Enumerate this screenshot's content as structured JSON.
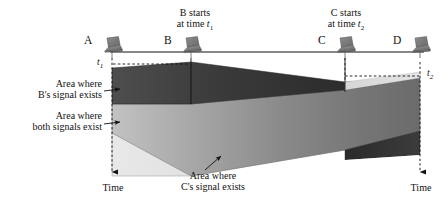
{
  "figure": {
    "type": "signal-propagation-timing-diagram",
    "width": 447,
    "height": 205,
    "background": "#ffffff"
  },
  "nodes": [
    {
      "id": "A",
      "label": "A",
      "icon": "laptop-icon",
      "x": 112,
      "label_x": 88,
      "label_y": 40
    },
    {
      "id": "B",
      "label": "B",
      "icon": "laptop-icon",
      "x": 191,
      "label_x": 168,
      "label_y": 40
    },
    {
      "id": "C",
      "label": "C",
      "icon": "laptop-icon",
      "x": 345,
      "label_x": 322,
      "label_y": 40
    },
    {
      "id": "D",
      "label": "D",
      "icon": "laptop-icon",
      "x": 420,
      "label_x": 396,
      "label_y": 40
    }
  ],
  "callouts": [
    {
      "name": "b-starts-callout",
      "line1": "B starts",
      "line2_prefix": "at time ",
      "line2_var": "t",
      "line2_sub": "1",
      "x": 160,
      "y": 8,
      "width": 70
    },
    {
      "name": "c-starts-callout",
      "line1": "C starts",
      "line2_prefix": "at time ",
      "line2_var": "t",
      "line2_sub": "2",
      "x": 310,
      "y": 8,
      "width": 70
    }
  ],
  "time_marks": [
    {
      "name": "t1-mark",
      "var": "t",
      "sub": "1",
      "x": 97,
      "y": 61
    },
    {
      "name": "t2-mark",
      "var": "t",
      "sub": "2",
      "x": 428,
      "y": 72
    }
  ],
  "annotations": [
    {
      "name": "b-signal-area-label",
      "line1": "Area where",
      "line2": "B's signal exists",
      "x": 14,
      "y": 79,
      "width": 90,
      "arrow_from": [
        104,
        91
      ],
      "arrow_to": [
        122,
        89
      ]
    },
    {
      "name": "both-signals-area-label",
      "line1": "Area where",
      "line2": "both signals exist",
      "x": 10,
      "y": 111,
      "width": 94,
      "arrow_from": [
        104,
        124
      ],
      "arrow_to": [
        122,
        122
      ]
    },
    {
      "name": "c-signal-area-label",
      "line1": "Area where",
      "line2": "C's signal exists",
      "x": 163,
      "y": 171,
      "width": 100,
      "arrow_from": [
        205,
        170
      ],
      "arrow_to": [
        222,
        155
      ]
    }
  ],
  "axes": [
    {
      "name": "left-time-axis",
      "label": "Time",
      "x": 112,
      "label_x": 96,
      "label_y": 185,
      "top": 56,
      "bottom": 176
    },
    {
      "name": "right-time-axis",
      "label": "Time",
      "x": 420,
      "label_x": 404,
      "label_y": 185,
      "top": 62,
      "bottom": 176
    }
  ],
  "regions": [
    {
      "name": "b-signal-region",
      "description": "Area where B's signal exists",
      "fill_light": "#4a4a4a",
      "fill_dark": "#2b2b2b"
    },
    {
      "name": "both-signals-region",
      "description": "Area where both signals exist",
      "fill_light": "#b8b8b8",
      "fill_dark": "#6f6f6f"
    },
    {
      "name": "c-signal-region",
      "description": "Area where C's signal exists",
      "fill_light": "#e0e0e0",
      "fill_dark": "#cacaca"
    }
  ],
  "bus": {
    "name": "bus-line",
    "y": 52,
    "x_start": 110,
    "x_end": 424,
    "color": "#111111"
  },
  "colors": {
    "ink": "#111111",
    "dashed": "#1a1a1a",
    "band_dark": "#3a3a3a",
    "band_mid": "#8e8e8e",
    "band_light": "#dcdcdc"
  }
}
